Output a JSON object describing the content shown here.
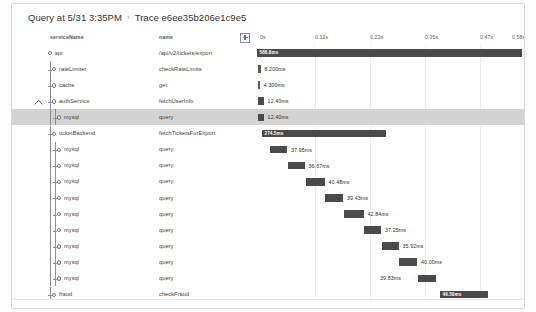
{
  "header": {
    "query_label": "Query at 5/31 3:35PM",
    "separator": "›",
    "trace_label": "Trace e6ee35b206e1c9e5"
  },
  "columns": {
    "service_header": "serviceName",
    "name_header": "name",
    "expand_icon": "plus-box-icon"
  },
  "axis": {
    "ticks": [
      {
        "label": "0s",
        "x": 248
      },
      {
        "label": "0.12s",
        "x": 303
      },
      {
        "label": "0.23s",
        "x": 358
      },
      {
        "label": "0.35s",
        "x": 413
      },
      {
        "label": "0.47s",
        "x": 468
      },
      {
        "label": "0.58s",
        "x": 500
      }
    ],
    "gridlines": [
      303,
      358,
      413,
      468
    ],
    "start": "0s",
    "end": "0.58s"
  },
  "chart_data": {
    "type": "bar",
    "title": "Trace e6ee35b206e1c9e5",
    "xlabel": "time",
    "ylabel": "span",
    "xlim": [
      0,
      0.5888
    ],
    "grid": true,
    "categories": [
      "api /api/v2/tickets/export",
      "rateLimiter checkRateLimits",
      "cache get",
      "authService fetchUserInfo",
      "mysql query",
      "ticketBackend fetchTicketsForExport",
      "mysql query",
      "mysql query",
      "mysql query",
      "mysql query",
      "mysql query",
      "mysql query",
      "mysql query",
      "mysql query",
      "mysql query",
      "fraud checkFraud"
    ],
    "values": [
      588.8,
      8.2,
      4.3,
      12.4,
      12.4,
      274.5,
      37.95,
      36.67,
      40.48,
      39.43,
      42.84,
      37.25,
      35.92,
      40.0,
      39.83,
      46.5
    ],
    "units": "ms"
  },
  "rows": [
    {
      "service": "api",
      "name": "/api/v2/tickets/export",
      "duration": "588.8ms",
      "depth": 0,
      "bar_left": 245,
      "bar_width": 265,
      "label_inside": true,
      "selected": false,
      "has_caret": false,
      "node": "root"
    },
    {
      "service": "rateLimiter",
      "name": "checkRateLimits",
      "duration": "8.200ms",
      "depth": 1,
      "bar_left": 246,
      "bar_width": 2.5,
      "label_inside": false,
      "selected": false,
      "has_caret": false,
      "node": "child"
    },
    {
      "service": "cache",
      "name": "get",
      "duration": "4.300ms",
      "depth": 1,
      "bar_left": 246,
      "bar_width": 1.8,
      "label_inside": false,
      "selected": false,
      "has_caret": false,
      "node": "child"
    },
    {
      "service": "authService",
      "name": "fetchUserInfo",
      "duration": "12.40ms",
      "depth": 1,
      "bar_left": 246,
      "bar_width": 5.6,
      "label_inside": false,
      "selected": false,
      "has_caret": true,
      "node": "child"
    },
    {
      "service": "mysql",
      "name": "query",
      "duration": "12.40ms",
      "depth": 2,
      "bar_left": 246,
      "bar_width": 5.6,
      "label_inside": false,
      "selected": true,
      "has_caret": false,
      "node": "child"
    },
    {
      "service": "ticketBackend",
      "name": "fetchTicketsForExport",
      "duration": "274.5ms",
      "depth": 1,
      "bar_left": 250,
      "bar_width": 124,
      "label_inside": true,
      "selected": false,
      "has_caret": false,
      "node": "child"
    },
    {
      "service": "mysql",
      "name": "query",
      "duration": "37.95ms",
      "depth": 2,
      "bar_left": 258,
      "bar_width": 17,
      "label_inside": false,
      "selected": false,
      "has_caret": false,
      "node": "child"
    },
    {
      "service": "mysql",
      "name": "query",
      "duration": "36.67ms",
      "depth": 2,
      "bar_left": 276,
      "bar_width": 16.5,
      "label_inside": false,
      "selected": false,
      "has_caret": false,
      "node": "child"
    },
    {
      "service": "mysql",
      "name": "query",
      "duration": "40.48ms",
      "depth": 2,
      "bar_left": 294,
      "bar_width": 18.5,
      "label_inside": false,
      "selected": false,
      "has_caret": false,
      "node": "child"
    },
    {
      "service": "mysql",
      "name": "query",
      "duration": "39.43ms",
      "depth": 2,
      "bar_left": 313,
      "bar_width": 18,
      "label_inside": false,
      "selected": false,
      "has_caret": false,
      "node": "child"
    },
    {
      "service": "mysql",
      "name": "query",
      "duration": "42.84ms",
      "depth": 2,
      "bar_left": 332,
      "bar_width": 19.5,
      "label_inside": false,
      "selected": false,
      "has_caret": false,
      "node": "child"
    },
    {
      "service": "mysql",
      "name": "query",
      "duration": "37.25ms",
      "depth": 2,
      "bar_left": 352,
      "bar_width": 17,
      "label_inside": false,
      "selected": false,
      "has_caret": false,
      "node": "child"
    },
    {
      "service": "mysql",
      "name": "query",
      "duration": "35.92ms",
      "depth": 2,
      "bar_left": 370,
      "bar_width": 16.5,
      "label_inside": false,
      "selected": false,
      "has_caret": false,
      "node": "child"
    },
    {
      "service": "mysql",
      "name": "query",
      "duration": "40.00ms",
      "depth": 2,
      "bar_left": 387,
      "bar_width": 18,
      "label_inside": false,
      "selected": false,
      "has_caret": false,
      "node": "child"
    },
    {
      "service": "mysql",
      "name": "query",
      "duration": "39.83ms",
      "depth": 2,
      "bar_left": 406,
      "bar_width": 18,
      "label_inside": false,
      "label_before": true,
      "selected": false,
      "has_caret": false,
      "node": "child"
    },
    {
      "service": "fraud",
      "name": "checkFraud",
      "duration": "46.50ms",
      "depth": 1,
      "bar_left": 428,
      "bar_width": 48,
      "label_inside": true,
      "selected": false,
      "has_caret": false,
      "node": "child"
    }
  ]
}
